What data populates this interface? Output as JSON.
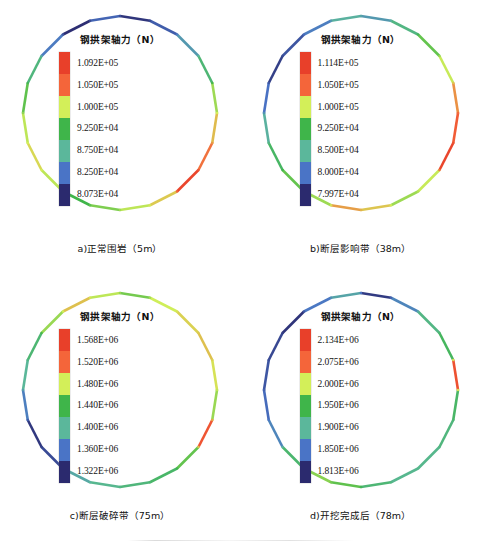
{
  "figure": {
    "legend_title": "钢拱架轴力（N）",
    "panels": [
      {
        "id": "a",
        "caption": "a)正常围岩（5m）",
        "ticks": [
          "1.092E+05",
          "1.050E+05",
          "1.000E+05",
          "9.250E+04",
          "8.750E+04",
          "8.250E+04",
          "8.073E+04"
        ]
      },
      {
        "id": "b",
        "caption": "b)断层影响带（38m）",
        "ticks": [
          "1.114E+05",
          "1.050E+05",
          "1.000E+05",
          "9.250E+04",
          "8.500E+04",
          "8.000E+04",
          "7.997E+04"
        ]
      },
      {
        "id": "c",
        "caption": "c)断层破碎带（75m）",
        "ticks": [
          "1.568E+06",
          "1.520E+06",
          "1.480E+06",
          "1.440E+06",
          "1.400E+06",
          "1.360E+06",
          "1.322E+06"
        ]
      },
      {
        "id": "d",
        "caption": "d)开挖完成后（78m）",
        "ticks": [
          "2.134E+06",
          "2.075E+06",
          "2.000E+06",
          "1.950E+06",
          "1.900E+06",
          "1.850E+06",
          "1.813E+06"
        ]
      }
    ]
  },
  "chart_data": {
    "type": "line",
    "title": "钢拱架轴力（N）",
    "colorbar": {
      "bands_top_to_bottom": [
        "#e8402a",
        "#f4653a",
        "#d3ef59",
        "#3fb54a",
        "#5bb79b",
        "#4a74c6",
        "#2b2a6e"
      ],
      "n_bands": 7,
      "orientation": "vertical"
    },
    "panels": [
      {
        "id": "a",
        "label": "a)正常围岩（5m）",
        "units": "N",
        "vmin": 80730,
        "vmax": 109200,
        "tick_values": [
          109200,
          105000,
          100000,
          92500,
          87500,
          82500,
          80730
        ],
        "tick_labels": [
          "1.092E+05",
          "1.050E+05",
          "1.000E+05",
          "9.250E+04",
          "8.750E+04",
          "8.250E+04",
          "8.073E+04"
        ],
        "segment_values_clockwise_from_top": [
          81500,
          84000,
          88000,
          92500,
          98000,
          101500,
          104000,
          108500,
          101000,
          99000,
          97000,
          95000,
          99000,
          100500,
          99000,
          96000,
          92000,
          86000,
          81000,
          84500
        ]
      },
      {
        "id": "b",
        "label": "b)断层影响带（38m）",
        "units": "N",
        "vmin": 79970,
        "vmax": 111400,
        "tick_values": [
          111400,
          105000,
          100000,
          92500,
          85000,
          80000,
          79970
        ],
        "tick_labels": [
          "1.114E+05",
          "1.050E+05",
          "1.000E+05",
          "9.250E+04",
          "8.500E+04",
          "8.000E+04",
          "7.997E+04"
        ],
        "segment_values_clockwise_from_top": [
          88000,
          92000,
          97000,
          100500,
          104500,
          107500,
          110500,
          100500,
          99000,
          102500,
          104000,
          99000,
          97000,
          94000,
          90000,
          85000,
          81500,
          83000,
          86000,
          90000
        ]
      },
      {
        "id": "c",
        "label": "c)断层破碎带（75m）",
        "units": "N",
        "vmin": 1322000,
        "vmax": 1568000,
        "tick_values": [
          1568000,
          1520000,
          1480000,
          1440000,
          1400000,
          1360000,
          1322000
        ],
        "tick_labels": [
          "1.568E+06",
          "1.520E+06",
          "1.480E+06",
          "1.440E+06",
          "1.400E+06",
          "1.360E+06",
          "1.322E+06"
        ],
        "segment_values_clockwise_from_top": [
          1460000,
          1485000,
          1495000,
          1500000,
          1490000,
          1470000,
          1545000,
          1455000,
          1430000,
          1420000,
          1410000,
          1395000,
          1340000,
          1330000,
          1370000,
          1405000,
          1425000,
          1470000,
          1500000,
          1480000
        ]
      },
      {
        "id": "d",
        "label": "d)开挖完成后（78m）",
        "units": "N",
        "vmin": 1813000,
        "vmax": 2134000,
        "tick_values": [
          2134000,
          2075000,
          2000000,
          1950000,
          1900000,
          1850000,
          1813000
        ],
        "tick_labels": [
          "2.134E+06",
          "2.075E+06",
          "2.000E+06",
          "1.950E+06",
          "1.900E+06",
          "1.850E+06",
          "1.813E+06"
        ],
        "segment_values_clockwise_from_top": [
          1825000,
          1880000,
          1935000,
          1960000,
          2110000,
          1955000,
          1940000,
          1930000,
          1928000,
          1945000,
          1985000,
          2000000,
          1950000,
          1880000,
          1860000,
          1845000,
          1835000,
          1820000,
          1870000,
          1905000
        ]
      }
    ]
  }
}
